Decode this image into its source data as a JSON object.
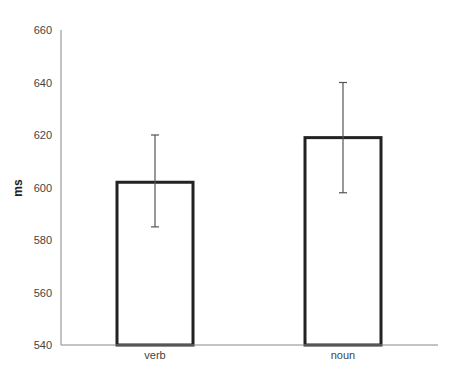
{
  "chart_data": {
    "type": "bar",
    "title": "",
    "xlabel": "",
    "ylabel": "ms",
    "ylim": [
      540,
      660
    ],
    "yticks": [
      540,
      560,
      580,
      600,
      620,
      640,
      660
    ],
    "categories": [
      "verb",
      "noun"
    ],
    "values": [
      602,
      619
    ],
    "error_bars": [
      {
        "category": "verb",
        "lower": 585,
        "upper": 620
      },
      {
        "category": "noun",
        "lower": 598,
        "upper": 640
      }
    ],
    "grid": false,
    "legend": null,
    "bar_style": {
      "fill": "#ffffff",
      "stroke": "#222222"
    }
  }
}
